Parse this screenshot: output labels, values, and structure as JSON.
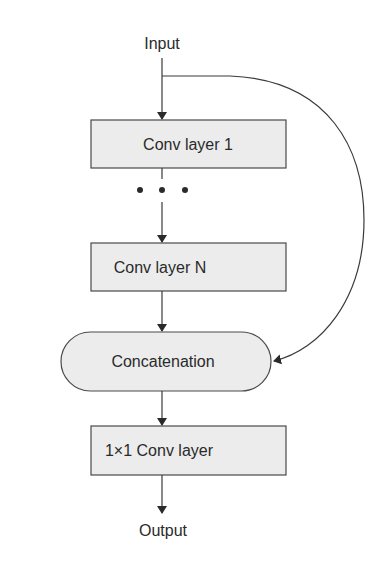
{
  "diagram": {
    "input_label": "Input",
    "output_label": "Output",
    "nodes": [
      {
        "id": "conv1",
        "label": "Conv layer 1",
        "shape": "rect"
      },
      {
        "id": "ellipsis",
        "label": "• • •",
        "shape": "ellipsis"
      },
      {
        "id": "convN",
        "label": "Conv layer N",
        "shape": "rect"
      },
      {
        "id": "concat",
        "label": "Concatenation",
        "shape": "pill"
      },
      {
        "id": "conv1x1",
        "label": "1×1 Conv layer",
        "shape": "rect"
      }
    ],
    "edges": [
      {
        "from": "Input",
        "to": "conv1"
      },
      {
        "from": "conv1",
        "to": "ellipsis"
      },
      {
        "from": "ellipsis",
        "to": "convN"
      },
      {
        "from": "convN",
        "to": "concat"
      },
      {
        "from": "Input",
        "to": "concat",
        "type": "skip-connection"
      },
      {
        "from": "concat",
        "to": "conv1x1"
      },
      {
        "from": "conv1x1",
        "to": "Output"
      }
    ],
    "colors": {
      "box_fill": "#ececec",
      "stroke": "#4a4a4a",
      "text": "#2a2a2a"
    }
  }
}
